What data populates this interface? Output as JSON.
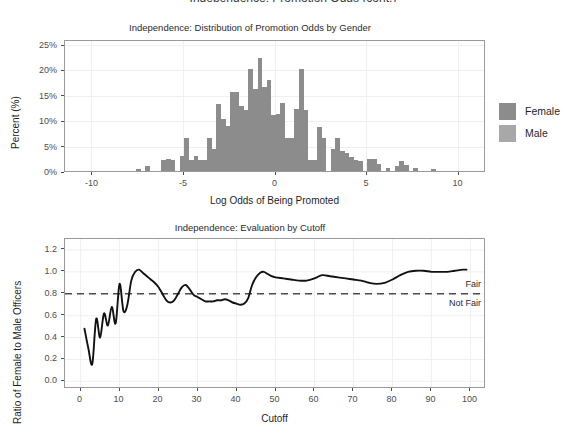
{
  "cut_header": "Independence: Promotion Odds (cont.)",
  "legend": {
    "title": "",
    "items": [
      {
        "label": "Female",
        "color": "#8c8c8c"
      },
      {
        "label": "Male",
        "color": "#a8a8a8"
      }
    ]
  },
  "chart_data": [
    {
      "id": "histogram",
      "type": "bar",
      "title": "Independence: Distribution of Promotion Odds by Gender",
      "xlabel": "Log Odds of Being Promoted",
      "ylabel": "Percent (%)",
      "grid": true,
      "legend_position": "right",
      "xlim": [
        -11.5,
        11.5
      ],
      "ylim": [
        0,
        26
      ],
      "xticks": [
        -10,
        -5,
        0,
        5,
        10
      ],
      "xtick_labels": [
        "-10",
        "-5",
        "0",
        "5",
        "10"
      ],
      "yticks": [
        0,
        5,
        10,
        15,
        20,
        25
      ],
      "ytick_labels": [
        "0%",
        "5%",
        "10%",
        "15%",
        "20%",
        "25%"
      ],
      "bin_width": 0.26,
      "series": [
        {
          "name": "Female",
          "color": "#8c8c8c",
          "x": [
            -7.5,
            -7.0,
            -6.1,
            -5.85,
            -5.6,
            -5.1,
            -4.85,
            -4.6,
            -4.35,
            -4.1,
            -3.85,
            -3.6,
            -3.35,
            -3.1,
            -2.85,
            -2.6,
            -2.35,
            -2.1,
            -1.85,
            -1.6,
            -1.35,
            -1.1,
            -0.85,
            -0.6,
            -0.35,
            -0.1,
            0.15,
            0.4,
            0.65,
            0.9,
            1.15,
            1.4,
            1.65,
            1.9,
            2.15,
            2.4,
            2.65,
            3.15,
            3.4,
            3.65,
            3.9,
            4.15,
            4.4,
            4.65,
            5.15,
            5.4,
            5.65,
            6.15,
            6.65,
            6.9,
            7.15,
            7.65,
            8.65
          ],
          "values": [
            0.4,
            1.0,
            2.2,
            2.3,
            2.2,
            3.0,
            6.6,
            2.2,
            2.9,
            2.1,
            2.1,
            6.6,
            4.4,
            13.2,
            10.2,
            8.8,
            15.5,
            15.5,
            12.8,
            12.0,
            20.0,
            16.2,
            22.2,
            16.6,
            17.9,
            11.0,
            11.2,
            13.4,
            6.5,
            6.6,
            12.2,
            20.0,
            12.1,
            2.2,
            2.2,
            8.6,
            6.6,
            4.4,
            6.6,
            4.0,
            3.6,
            2.8,
            2.1,
            2.0,
            2.4,
            2.4,
            1.4,
            0.6,
            1.0,
            2.0,
            1.2,
            0.5,
            0.4
          ]
        }
      ]
    },
    {
      "id": "evaluation",
      "type": "line",
      "title": "Independence: Evaluation by Cutoff",
      "xlabel": "Cutoff",
      "ylabel": "Ratio of Female to Male Officers",
      "grid": true,
      "xlim": [
        -4,
        104
      ],
      "ylim": [
        -0.07,
        1.3
      ],
      "xticks": [
        0,
        10,
        20,
        30,
        40,
        50,
        60,
        70,
        80,
        90,
        100
      ],
      "xtick_labels": [
        "0",
        "10",
        "20",
        "30",
        "40",
        "50",
        "60",
        "70",
        "80",
        "90",
        "100"
      ],
      "yticks": [
        0.0,
        0.2,
        0.4,
        0.6,
        0.8,
        1.0,
        1.2
      ],
      "ytick_labels": [
        "0.0",
        "0.2",
        "0.4",
        "0.6",
        "0.8",
        "1.0",
        "1.2"
      ],
      "threshold": {
        "value": 0.8,
        "style": "dashed",
        "color": "#4d4d4d"
      },
      "annotations": [
        {
          "text": "Fair",
          "x": 97,
          "y": 0.87
        },
        {
          "text": "Not Fair",
          "x": 97,
          "y": 0.7
        }
      ],
      "series": [
        {
          "name": "Ratio of Female to Male Officers",
          "color": "#111111",
          "x": [
            1,
            2,
            3,
            4,
            5,
            6,
            7,
            8,
            9,
            10,
            11,
            12,
            13,
            14,
            15,
            16,
            17,
            18,
            19,
            20,
            21,
            22,
            23,
            24,
            25,
            26,
            27,
            28,
            29,
            30,
            31,
            32,
            33,
            34,
            35,
            36,
            37,
            38,
            39,
            40,
            41,
            42,
            43,
            44,
            45,
            46,
            47,
            48,
            49,
            50,
            52,
            54,
            56,
            58,
            60,
            62,
            64,
            66,
            68,
            70,
            72,
            74,
            76,
            78,
            80,
            82,
            84,
            86,
            88,
            90,
            92,
            94,
            96,
            98,
            99
          ],
          "values": [
            0.48,
            0.3,
            0.16,
            0.57,
            0.4,
            0.62,
            0.51,
            0.68,
            0.53,
            0.89,
            0.64,
            0.7,
            0.92,
            1.0,
            1.02,
            0.99,
            0.96,
            0.93,
            0.9,
            0.86,
            0.8,
            0.74,
            0.72,
            0.74,
            0.8,
            0.86,
            0.88,
            0.84,
            0.79,
            0.77,
            0.75,
            0.73,
            0.73,
            0.73,
            0.74,
            0.74,
            0.75,
            0.74,
            0.72,
            0.71,
            0.7,
            0.71,
            0.76,
            0.88,
            0.95,
            0.99,
            1.0,
            0.98,
            0.96,
            0.95,
            0.94,
            0.93,
            0.92,
            0.92,
            0.94,
            0.97,
            0.96,
            0.95,
            0.94,
            0.93,
            0.92,
            0.9,
            0.89,
            0.9,
            0.93,
            0.97,
            1.0,
            1.01,
            1.01,
            1.0,
            1.0,
            1.0,
            1.01,
            1.02,
            1.02
          ]
        }
      ]
    }
  ]
}
